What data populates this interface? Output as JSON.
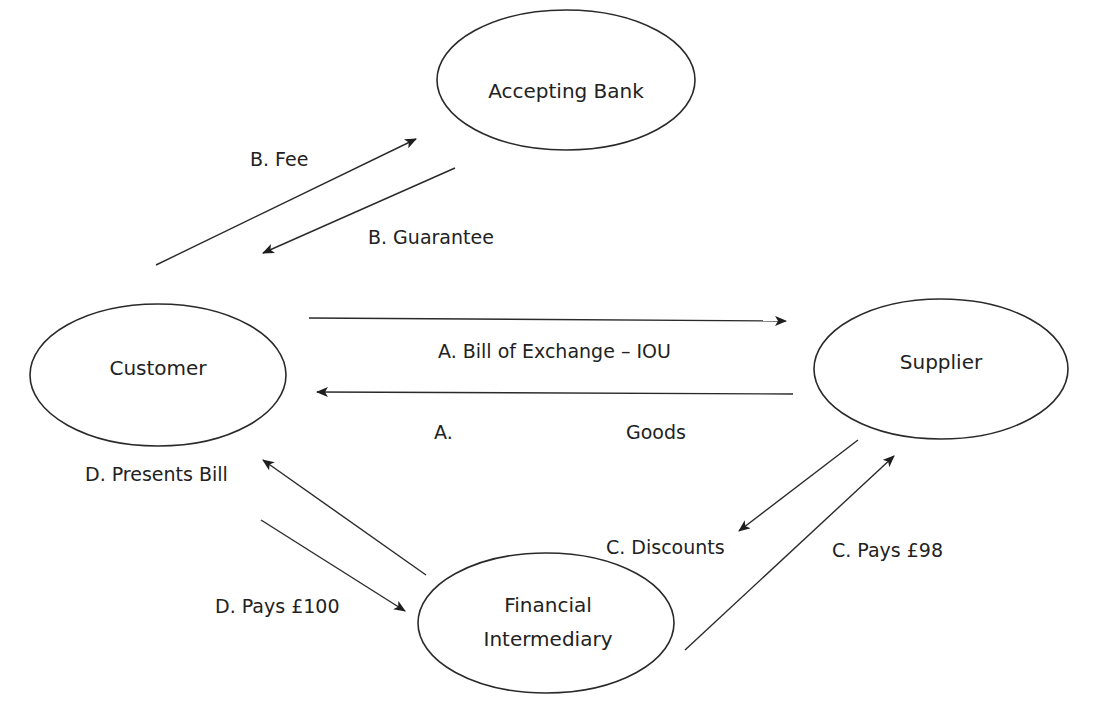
{
  "diagram": {
    "type": "flow",
    "nodes": [
      {
        "id": "bank",
        "label_lines": [
          "Accepting Bank"
        ]
      },
      {
        "id": "customer",
        "label_lines": [
          "Customer"
        ]
      },
      {
        "id": "supplier",
        "label_lines": [
          "Supplier"
        ]
      },
      {
        "id": "intermediary",
        "label_lines": [
          "Financial",
          "Intermediary"
        ]
      }
    ],
    "edges": [
      {
        "id": "b-fee",
        "from": "customer",
        "to": "bank",
        "label": "B. Fee"
      },
      {
        "id": "b-guarantee",
        "from": "bank",
        "to": "customer",
        "label": "B. Guarantee"
      },
      {
        "id": "a-bill",
        "from": "customer",
        "to": "supplier",
        "label": "A. Bill of Exchange – IOU"
      },
      {
        "id": "a-goods",
        "from": "supplier",
        "to": "customer",
        "label_a": "A.",
        "label_b": "Goods"
      },
      {
        "id": "d-presents",
        "from": "intermediary",
        "to": "customer",
        "label": "D. Presents Bill"
      },
      {
        "id": "d-pays",
        "from": "customer",
        "to": "intermediary",
        "label": "D. Pays £100"
      },
      {
        "id": "c-discounts",
        "from": "supplier",
        "to": "intermediary",
        "label": "C. Discounts"
      },
      {
        "id": "c-pays",
        "from": "intermediary",
        "to": "supplier",
        "label": "C. Pays £98"
      }
    ]
  },
  "colors": {
    "stroke": "#2a2a2a",
    "text": "#222222",
    "background": "#ffffff"
  }
}
